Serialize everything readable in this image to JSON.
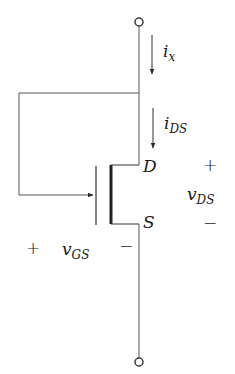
{
  "diagram": {
    "type": "circuit",
    "colors": {
      "wire": "#3a3a3a",
      "text": "#1a1a1a",
      "background": "#ffffff"
    },
    "terminals": [
      {
        "name": "top-terminal"
      },
      {
        "name": "bottom-terminal"
      }
    ],
    "currents": {
      "ix": {
        "main": "i",
        "sub": "x"
      },
      "ids": {
        "main": "i",
        "sub": "DS"
      }
    },
    "transistor": {
      "drain_label": "D",
      "source_label": "S"
    },
    "voltages": {
      "vds": {
        "main": "v",
        "sub": "DS",
        "plus": "+",
        "minus": "−"
      },
      "vgs": {
        "main": "v",
        "sub": "GS",
        "plus": "+",
        "minus": "−"
      }
    }
  }
}
